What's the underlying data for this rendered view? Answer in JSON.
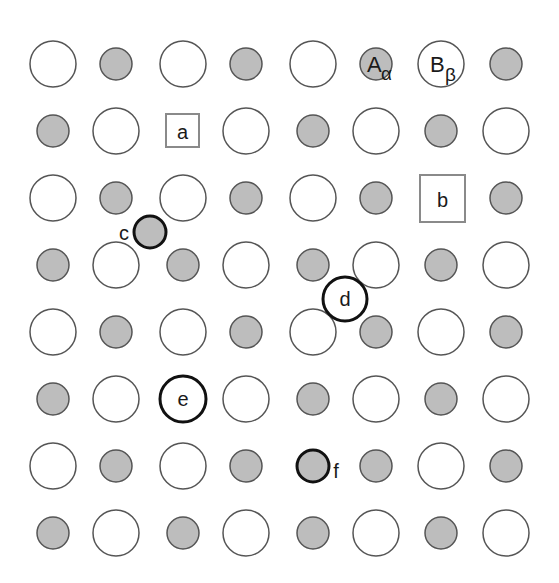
{
  "diagram": {
    "colors": {
      "background": "#ffffff",
      "large_fill": "#ffffff",
      "small_fill": "#bdbdbd",
      "stroke": "#555555",
      "bold_stroke": "#111111",
      "vacancy_stroke": "#8a8a8a"
    },
    "grid": {
      "columns": [
        53,
        116,
        183,
        246,
        313,
        376,
        441,
        506
      ],
      "rows": [
        64,
        131,
        198,
        265,
        332,
        399,
        466,
        533
      ],
      "large_radius": 23,
      "small_radius": 16
    },
    "lattice_labels": {
      "A_main": "A",
      "A_sub": "α",
      "B_main": "B",
      "B_sub": "β"
    },
    "defects": [
      {
        "id": "a",
        "label": "a",
        "type": "vacancy",
        "shape": "square",
        "row": 1,
        "col": 2,
        "replaces": "small"
      },
      {
        "id": "b",
        "label": "b",
        "type": "vacancy",
        "shape": "square",
        "row": 2,
        "col": 6,
        "replaces": "large"
      },
      {
        "id": "c",
        "label": "c",
        "type": "interstitial",
        "shape": "small",
        "x": 150,
        "y": 232,
        "label_pos": "left"
      },
      {
        "id": "d",
        "label": "d",
        "type": "interstitial",
        "shape": "large",
        "x": 345,
        "y": 299,
        "label_pos": "center"
      },
      {
        "id": "e",
        "label": "e",
        "type": "substitution",
        "shape": "large",
        "row": 5,
        "col": 2,
        "replaces": "small",
        "label_pos": "center"
      },
      {
        "id": "f",
        "label": "f",
        "type": "substitution",
        "shape": "small",
        "row": 6,
        "col": 4,
        "replaces": "large",
        "label_pos": "right"
      }
    ],
    "labels": {
      "a": "a",
      "b": "b",
      "c": "c",
      "d": "d",
      "e": "e",
      "f": "f"
    }
  }
}
